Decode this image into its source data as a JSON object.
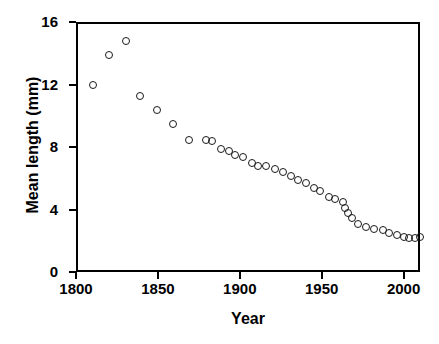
{
  "chart_data": {
    "type": "scatter",
    "title": "",
    "xlabel": "Year",
    "ylabel": "Mean length (mm)",
    "xlim": [
      1800,
      2010
    ],
    "ylim": [
      0,
      16
    ],
    "xticks": [
      1800,
      1850,
      1900,
      1950,
      2000
    ],
    "yticks": [
      0,
      4,
      8,
      12,
      16
    ],
    "grid": false,
    "legend": null,
    "marker": "open-circle",
    "series": [
      {
        "name": "Mean length",
        "points": [
          {
            "x": 1809,
            "y": 12.1
          },
          {
            "x": 1819,
            "y": 14.0
          },
          {
            "x": 1829,
            "y": 14.9
          },
          {
            "x": 1838,
            "y": 11.4
          },
          {
            "x": 1848,
            "y": 10.5
          },
          {
            "x": 1858,
            "y": 9.6
          },
          {
            "x": 1868,
            "y": 8.6
          },
          {
            "x": 1878,
            "y": 8.6
          },
          {
            "x": 1882,
            "y": 8.5
          },
          {
            "x": 1887,
            "y": 8.0
          },
          {
            "x": 1892,
            "y": 7.9
          },
          {
            "x": 1896,
            "y": 7.6
          },
          {
            "x": 1901,
            "y": 7.5
          },
          {
            "x": 1906,
            "y": 7.1
          },
          {
            "x": 1910,
            "y": 6.9
          },
          {
            "x": 1915,
            "y": 6.9
          },
          {
            "x": 1920,
            "y": 6.7
          },
          {
            "x": 1925,
            "y": 6.5
          },
          {
            "x": 1930,
            "y": 6.3
          },
          {
            "x": 1934,
            "y": 6.0
          },
          {
            "x": 1939,
            "y": 5.8
          },
          {
            "x": 1944,
            "y": 5.5
          },
          {
            "x": 1948,
            "y": 5.3
          },
          {
            "x": 1953,
            "y": 4.9
          },
          {
            "x": 1957,
            "y": 4.8
          },
          {
            "x": 1962,
            "y": 4.6
          },
          {
            "x": 1967,
            "y": 3.6
          },
          {
            "x": 1971,
            "y": 3.2
          },
          {
            "x": 1976,
            "y": 3.0
          },
          {
            "x": 1981,
            "y": 2.9
          },
          {
            "x": 1986,
            "y": 2.8
          },
          {
            "x": 1990,
            "y": 2.6
          },
          {
            "x": 1995,
            "y": 2.5
          },
          {
            "x": 1999,
            "y": 2.4
          },
          {
            "x": 2002,
            "y": 2.3
          },
          {
            "x": 2006,
            "y": 2.3
          },
          {
            "x": 2009,
            "y": 2.4
          },
          {
            "x": 1963,
            "y": 4.2
          },
          {
            "x": 1965,
            "y": 3.9
          }
        ]
      }
    ]
  }
}
